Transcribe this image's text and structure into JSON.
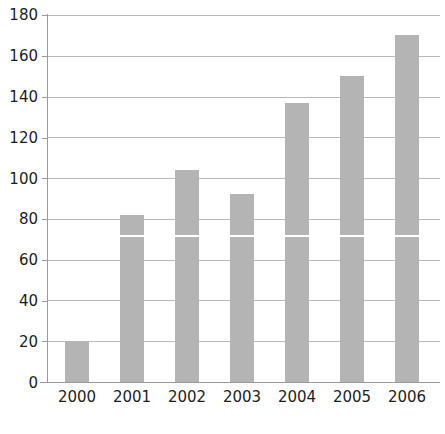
{
  "chart_data": {
    "type": "bar",
    "title": "",
    "subtitle": "",
    "xlabel": "",
    "ylabel": "",
    "categories": [
      "2000",
      "2001",
      "2002",
      "2003",
      "2004",
      "2005",
      "2006"
    ],
    "values": [
      20,
      82,
      104,
      92,
      137,
      150,
      170
    ],
    "ylim": [
      0,
      180
    ],
    "ytick_step": 20,
    "yticks": [
      0,
      20,
      40,
      60,
      80,
      100,
      120,
      140,
      160,
      180
    ],
    "ytick_labels": [
      "0",
      "20",
      "40",
      "60",
      "80",
      "100",
      "120",
      "140",
      "160",
      "180"
    ],
    "grid": true,
    "grid_axis": "y",
    "legend": false,
    "legend_position": "none",
    "series": [
      {
        "name": "",
        "values": [
          20,
          82,
          104,
          92,
          137,
          150,
          170
        ]
      }
    ],
    "annotations": [],
    "colors": {
      "bar_fill": "#b4b4b4",
      "gridline": "#b9b9b9",
      "axis_line": "#9a9a9a",
      "tick_label": "#1d1d1d",
      "background": "#ffffff",
      "overlay_line": "#ffffff"
    },
    "overlay_line_value": 72
  }
}
